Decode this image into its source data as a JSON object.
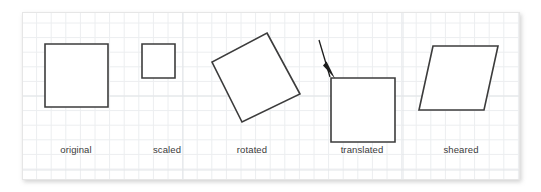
{
  "figure": {
    "background_color": "#ffffff",
    "panel": {
      "x": 22,
      "y": 12,
      "width": 498,
      "height": 168,
      "fill": "#ffffff",
      "border_color": "#e6e6e6"
    },
    "grid": {
      "minor_spacing": 14.6,
      "minor_color": "#eceef0",
      "major_color": "#e2e5e8",
      "major_vertical_x": [
        183,
        403
      ],
      "major_horizontal_y": [
        96,
        170
      ]
    },
    "stroke_color": "#3c3c3c",
    "shape_fill": "#ffffff",
    "label_color": "#3a3a3a",
    "arrow_color": "#1c1c1c",
    "shapes": [
      {
        "id": "original",
        "label": "original",
        "type": "square",
        "points": "45,44 108,44 108,107 45,107",
        "label_x": 76,
        "label_y": 153
      },
      {
        "id": "scaled",
        "label": "scaled",
        "type": "square",
        "points": "142,44 175,44 175,78 142,78",
        "label_x": 167,
        "label_y": 153
      },
      {
        "id": "rotated",
        "label": "rotated",
        "type": "square",
        "points": "267,33 300,94 242,122 212,62",
        "label_x": 252,
        "label_y": 153
      },
      {
        "id": "translated",
        "label": "translated",
        "type": "square",
        "points": "331,78 395,78 395,142 331,142",
        "label_x": 362,
        "label_y": 153
      },
      {
        "id": "sheared",
        "label": "sheared",
        "type": "parallelogram",
        "points": "433,46 498,46 484,110 419,110",
        "label_x": 461,
        "label_y": 153
      }
    ],
    "arrow": {
      "id": "translation-arrow",
      "from_x": 319,
      "from_y": 40,
      "to_x": 331,
      "to_y": 78,
      "head": "326.6,61.5 335.0,78.5 323.0,65.5"
    }
  }
}
